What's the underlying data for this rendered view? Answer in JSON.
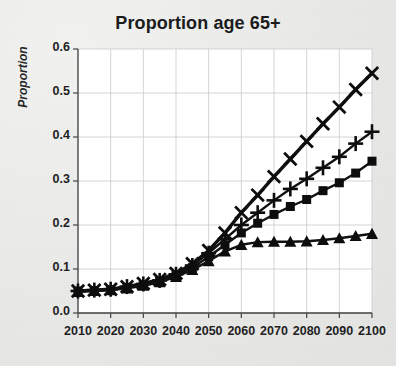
{
  "chart_data": {
    "type": "line",
    "title": "Proportion age 65+",
    "xlabel": "",
    "ylabel": "Proportion",
    "xlim": [
      2010,
      2100
    ],
    "ylim": [
      0.0,
      0.6
    ],
    "grid": true,
    "legend": "none",
    "x": [
      2010,
      2015,
      2020,
      2025,
      2030,
      2035,
      2040,
      2045,
      2050,
      2055,
      2060,
      2065,
      2070,
      2075,
      2080,
      2085,
      2090,
      2095,
      2100
    ],
    "ytick_labels": [
      "0.0",
      "0.1",
      "0.2",
      "0.3",
      "0.4",
      "0.5",
      "0.6"
    ],
    "ytick_values": [
      0.0,
      0.1,
      0.2,
      0.3,
      0.4,
      0.5,
      0.6
    ],
    "xtick_labels": [
      "2010",
      "2020",
      "2030",
      "2040",
      "2050",
      "2060",
      "2070",
      "2080",
      "2090",
      "2100"
    ],
    "xtick_values": [
      2010,
      2020,
      2030,
      2040,
      2050,
      2060,
      2070,
      2080,
      2090,
      2100
    ],
    "series": [
      {
        "name": "series-x",
        "marker": "x-cross",
        "color": "#111111",
        "values": [
          0.05,
          0.052,
          0.054,
          0.06,
          0.067,
          0.076,
          0.09,
          0.112,
          0.142,
          0.182,
          0.228,
          0.268,
          0.31,
          0.35,
          0.39,
          0.43,
          0.468,
          0.508,
          0.545
        ]
      },
      {
        "name": "series-plus",
        "marker": "plus",
        "color": "#111111",
        "values": [
          0.05,
          0.052,
          0.054,
          0.06,
          0.066,
          0.074,
          0.088,
          0.108,
          0.136,
          0.168,
          0.2,
          0.228,
          0.256,
          0.282,
          0.305,
          0.33,
          0.355,
          0.385,
          0.412
        ]
      },
      {
        "name": "series-square",
        "marker": "square",
        "color": "#111111",
        "values": [
          0.05,
          0.051,
          0.053,
          0.058,
          0.064,
          0.072,
          0.085,
          0.103,
          0.128,
          0.155,
          0.182,
          0.204,
          0.224,
          0.242,
          0.258,
          0.278,
          0.296,
          0.318,
          0.345
        ]
      },
      {
        "name": "series-triangle",
        "marker": "triangle",
        "color": "#111111",
        "values": [
          0.048,
          0.05,
          0.052,
          0.056,
          0.062,
          0.07,
          0.082,
          0.098,
          0.118,
          0.14,
          0.155,
          0.161,
          0.162,
          0.162,
          0.163,
          0.166,
          0.17,
          0.175,
          0.18
        ]
      }
    ]
  }
}
